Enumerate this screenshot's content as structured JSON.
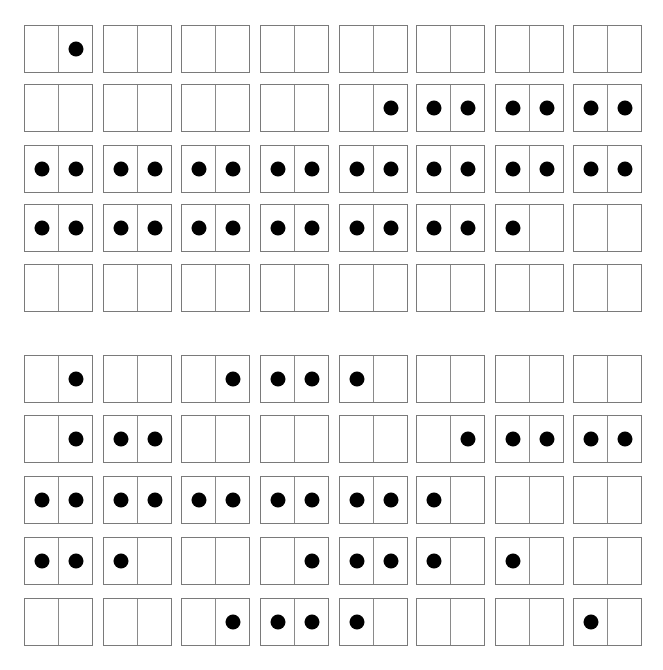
{
  "colors": {
    "line": "#7a7a7a",
    "dot": "#000000",
    "background": "#ffffff"
  },
  "layout": {
    "columns_x": [
      24,
      103,
      181,
      260,
      339,
      416,
      495,
      573
    ],
    "sections": [
      {
        "rows_y": [
          25,
          84,
          145,
          204,
          264
        ]
      },
      {
        "rows_y": [
          355,
          415,
          476,
          537,
          598
        ]
      }
    ]
  },
  "sections": [
    {
      "name": "top-grid",
      "rows": [
        [
          [
            0,
            1
          ],
          [
            0,
            0
          ],
          [
            0,
            0
          ],
          [
            0,
            0
          ],
          [
            0,
            0
          ],
          [
            0,
            0
          ],
          [
            0,
            0
          ],
          [
            0,
            0
          ]
        ],
        [
          [
            0,
            0
          ],
          [
            0,
            0
          ],
          [
            0,
            0
          ],
          [
            0,
            0
          ],
          [
            0,
            1
          ],
          [
            1,
            1
          ],
          [
            1,
            1
          ],
          [
            1,
            1
          ]
        ],
        [
          [
            1,
            1
          ],
          [
            1,
            1
          ],
          [
            1,
            1
          ],
          [
            1,
            1
          ],
          [
            1,
            1
          ],
          [
            1,
            1
          ],
          [
            1,
            1
          ],
          [
            1,
            1
          ]
        ],
        [
          [
            1,
            1
          ],
          [
            1,
            1
          ],
          [
            1,
            1
          ],
          [
            1,
            1
          ],
          [
            1,
            1
          ],
          [
            1,
            1
          ],
          [
            1,
            0
          ],
          [
            0,
            0
          ]
        ],
        [
          [
            0,
            0
          ],
          [
            0,
            0
          ],
          [
            0,
            0
          ],
          [
            0,
            0
          ],
          [
            0,
            0
          ],
          [
            0,
            0
          ],
          [
            0,
            0
          ],
          [
            0,
            0
          ]
        ]
      ]
    },
    {
      "name": "bottom-grid",
      "rows": [
        [
          [
            0,
            1
          ],
          [
            0,
            0
          ],
          [
            0,
            1
          ],
          [
            1,
            1
          ],
          [
            1,
            0
          ],
          [
            0,
            0
          ],
          [
            0,
            0
          ],
          [
            0,
            0
          ]
        ],
        [
          [
            0,
            1
          ],
          [
            1,
            1
          ],
          [
            0,
            0
          ],
          [
            0,
            0
          ],
          [
            0,
            0
          ],
          [
            0,
            1
          ],
          [
            1,
            1
          ],
          [
            1,
            1
          ]
        ],
        [
          [
            1,
            1
          ],
          [
            1,
            1
          ],
          [
            1,
            1
          ],
          [
            1,
            1
          ],
          [
            1,
            1
          ],
          [
            1,
            0
          ],
          [
            0,
            0
          ],
          [
            0,
            0
          ]
        ],
        [
          [
            1,
            1
          ],
          [
            1,
            0
          ],
          [
            0,
            0
          ],
          [
            0,
            1
          ],
          [
            1,
            1
          ],
          [
            1,
            0
          ],
          [
            1,
            0
          ],
          [
            0,
            0
          ]
        ],
        [
          [
            0,
            0
          ],
          [
            0,
            0
          ],
          [
            0,
            1
          ],
          [
            1,
            1
          ],
          [
            1,
            0
          ],
          [
            0,
            0
          ],
          [
            0,
            0
          ],
          [
            1,
            0
          ]
        ]
      ]
    }
  ]
}
